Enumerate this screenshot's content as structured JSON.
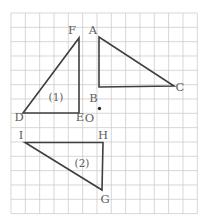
{
  "figure": {
    "type": "geometry-grid-diagram",
    "canvas": {
      "width": 212,
      "height": 224,
      "background": "#ffffff"
    },
    "grid": {
      "x": 11,
      "y": 13,
      "cols": 13,
      "rows": 14,
      "cell": 14.33,
      "color": "#c9c9c9",
      "line_width": 0.75
    },
    "style": {
      "shape_stroke": "#3f3f3f",
      "shape_stroke_width": 1.6,
      "label_color": "#5d5d5d",
      "label_font_size": 11.5,
      "tag_font_size": 10.5
    },
    "triangles": [
      {
        "id": "triangle-1-DEF",
        "points": "23,113 79,113 79,38",
        "tag": {
          "text": "(1)",
          "x": 56,
          "y": 101
        }
      },
      {
        "id": "triangle-ABC",
        "points": "99,37 99,87 174,86"
      },
      {
        "id": "triangle-2-IHG",
        "points": "25,142.5 103,142.5 102,190",
        "tag": {
          "text": "(2)",
          "x": 82,
          "y": 167
        }
      }
    ],
    "vertex_labels": [
      {
        "text": "F",
        "x": 72,
        "y": 33.5
      },
      {
        "text": "A",
        "x": 93,
        "y": 33.5
      },
      {
        "text": "B",
        "x": 93.5,
        "y": 101.5
      },
      {
        "text": "C",
        "x": 180,
        "y": 91
      },
      {
        "text": "D",
        "x": 19,
        "y": 120.5
      },
      {
        "text": "E",
        "x": 80,
        "y": 121
      },
      {
        "text": "O",
        "x": 89.5,
        "y": 122
      },
      {
        "text": "I",
        "x": 21,
        "y": 139
      },
      {
        "text": "H",
        "x": 103,
        "y": 139
      },
      {
        "text": "G",
        "x": 105,
        "y": 203
      }
    ],
    "center_point": {
      "x": 99.5,
      "y": 108.5,
      "r": 1.7,
      "color": "#2b2b2b"
    }
  }
}
